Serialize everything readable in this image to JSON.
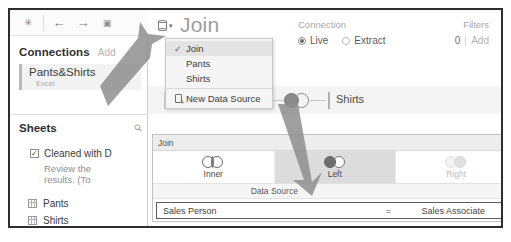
{
  "toolbar": {
    "icons": [
      {
        "name": "data-interpreter-icon",
        "glyph": "✳"
      },
      {
        "name": "back-arrow-icon",
        "glyph": "←"
      },
      {
        "name": "forward-arrow-icon",
        "glyph": "→"
      },
      {
        "name": "save-icon",
        "glyph": "▣"
      }
    ]
  },
  "sidebar": {
    "connections": {
      "title": "Connections",
      "add_label": "Add",
      "item": {
        "name": "Pants&Shirts",
        "type": "Excel"
      }
    },
    "sheets": {
      "title": "Sheets",
      "search_icon": "search-icon",
      "checkbox_item": {
        "label": "Cleaned with D",
        "checked": true,
        "check_glyph": "✓"
      },
      "note": "Review the results. (To",
      "items": [
        {
          "label": "Pants",
          "icon": "table-grid-icon"
        },
        {
          "label": "Shirts",
          "icon": "table-grid-icon"
        }
      ]
    }
  },
  "header": {
    "datasource_icon": "database-icon",
    "datasource_caret": "▾",
    "title": "Join",
    "connection": {
      "label": "Connection",
      "options": [
        {
          "label": "Live",
          "selected": true
        },
        {
          "label": "Extract",
          "selected": false
        }
      ]
    },
    "filters": {
      "label": "Filters",
      "count": "0",
      "add_label": "Add"
    }
  },
  "canvas": {
    "left_node_label": "Data Source",
    "join_icon": "left-join-venn-icon",
    "right_node_label": "Shirts"
  },
  "menu": {
    "items": [
      {
        "label": "Join",
        "checked": true,
        "check_glyph": "✓"
      },
      {
        "label": "Pants",
        "checked": false
      },
      {
        "label": "Shirts",
        "checked": false
      }
    ],
    "footer_item": {
      "label": "New Data Source",
      "icon": "new-data-source-icon"
    }
  },
  "join_dialog": {
    "title": "Join",
    "close_glyph": "×",
    "types": [
      {
        "label": "Inner",
        "selected": false,
        "disabled": false,
        "icon": "inner-join-venn-icon"
      },
      {
        "label": "Left",
        "selected": true,
        "disabled": false,
        "icon": "left-join-venn-icon"
      },
      {
        "label": "Right",
        "selected": false,
        "disabled": true,
        "icon": "right-join-venn-icon"
      },
      {
        "label": "Full Outer",
        "selected": false,
        "disabled": true,
        "icon": "full-outer-join-venn-icon"
      }
    ],
    "column_headers": [
      "Data Source",
      "Shirts"
    ],
    "clause": {
      "left_field": "Sales Person",
      "operator": "=",
      "right_field": "Sales Associate"
    }
  },
  "colors": {
    "frame": "#2e2e2e",
    "selected_tab_bg": "#dcdcdc",
    "title_gray": "#9e9e9e",
    "annotation_arrow": "#8f8f8f"
  }
}
